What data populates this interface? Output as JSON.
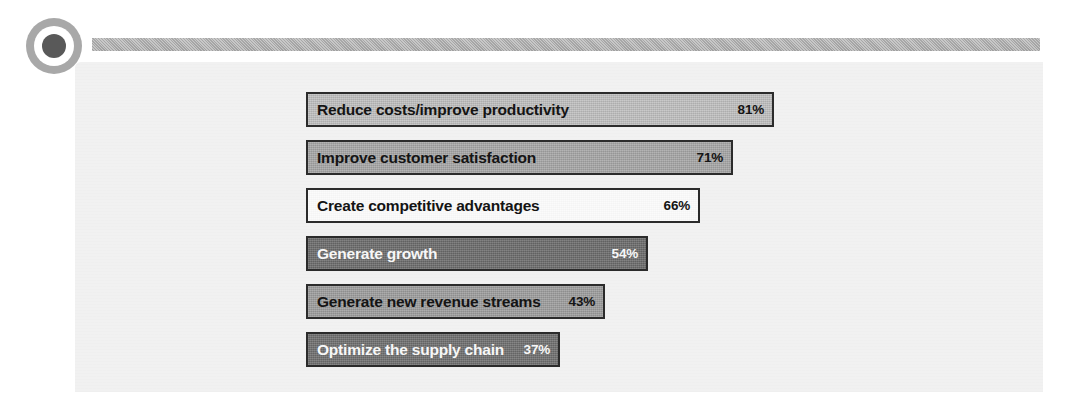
{
  "decor": {
    "bullet_icon": "circle-bullet-icon",
    "rule_name": "header-rule"
  },
  "chart_data": {
    "type": "bar",
    "orientation": "horizontal",
    "title": "",
    "subtitle": "",
    "xlabel": "",
    "ylabel": "",
    "grid": false,
    "legend": null,
    "value_suffix": "%",
    "xlim": [
      0,
      100
    ],
    "categories": [
      "Reduce costs/improve productivity",
      "Improve customer satisfaction",
      "Create competitive advantages",
      "Generate growth",
      "Generate new revenue streams",
      "Optimize the supply chain"
    ],
    "values": [
      81,
      71,
      66,
      54,
      43,
      37
    ],
    "value_labels": [
      "81%",
      "71%",
      "66%",
      "54%",
      "43%",
      "37%"
    ],
    "bars": [
      {
        "label": "Reduce costs/improve productivity",
        "value": 81,
        "value_label": "81%",
        "width_px": 468,
        "fill": "#c0c0c0",
        "text_color": "#141414",
        "border": "#2b2b2b",
        "tone_class": "tone-light",
        "text_class": "txt-black"
      },
      {
        "label": "Improve customer satisfaction",
        "value": 71,
        "value_label": "71%",
        "width_px": 427,
        "fill": "#a6a6a6",
        "text_color": "#141414",
        "border": "#2b2b2b",
        "tone_class": "tone-mid",
        "text_class": "txt-black"
      },
      {
        "label": "Create competitive advantages",
        "value": 66,
        "value_label": "66%",
        "width_px": 394,
        "fill": "#fbfbfb",
        "text_color": "#141414",
        "border": "#2b2b2b",
        "tone_class": "tone-white",
        "text_class": "txt-black"
      },
      {
        "label": "Generate growth",
        "value": 54,
        "value_label": "54%",
        "width_px": 342,
        "fill": "#6b6b6b",
        "text_color": "#f7f7f7",
        "border": "#2b2b2b",
        "tone_class": "tone-dark",
        "text_class": "txt-white"
      },
      {
        "label": "Generate new revenue streams",
        "value": 43,
        "value_label": "43%",
        "width_px": 299,
        "fill": "#9d9d9d",
        "text_color": "#141414",
        "border": "#2b2b2b",
        "tone_class": "tone-mid2",
        "text_class": "txt-black"
      },
      {
        "label": "Optimize the supply chain",
        "value": 37,
        "value_label": "37%",
        "width_px": 254,
        "fill": "#6f6f6f",
        "text_color": "#f7f7f7",
        "border": "#2b2b2b",
        "tone_class": "tone-dark2",
        "text_class": "txt-white"
      }
    ]
  },
  "colors": {
    "page_background": "#ffffff",
    "panel_background": "#f1f1f1",
    "rule": "#aeaeae",
    "bullet_outer": "#a8a8a8",
    "bullet_inner": "#595959",
    "bar_border": "#2b2b2b"
  }
}
